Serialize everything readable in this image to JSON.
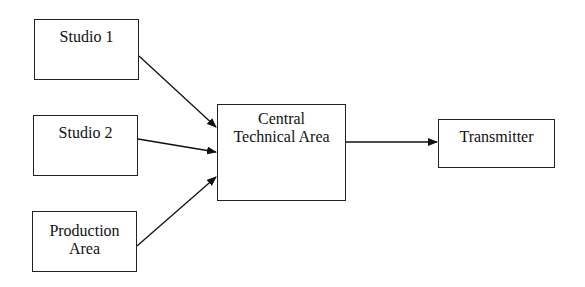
{
  "nodes": [
    {
      "id": "studio1",
      "label": "Studio 1",
      "x": 34,
      "y": 19,
      "w": 105,
      "h": 61,
      "pad": 8
    },
    {
      "id": "studio2",
      "label": "Studio 2",
      "x": 33,
      "y": 115,
      "w": 105,
      "h": 61,
      "pad": 8
    },
    {
      "id": "production",
      "label": "Production Area",
      "line1": "Production",
      "line2": "Area",
      "x": 32,
      "y": 211,
      "w": 105,
      "h": 61,
      "pad": 8
    },
    {
      "id": "central",
      "label": "Central Technical Area",
      "line1": "Central",
      "line2": "Technical Area",
      "x": 217,
      "y": 104,
      "w": 129,
      "h": 97,
      "pad": 5
    },
    {
      "id": "transmitter",
      "label": "Transmitter",
      "x": 438,
      "y": 119,
      "w": 117,
      "h": 49,
      "pad": 8
    }
  ],
  "edges": [
    {
      "from": "studio1",
      "to": "central"
    },
    {
      "from": "studio2",
      "to": "central"
    },
    {
      "from": "production",
      "to": "central"
    },
    {
      "from": "central",
      "to": "transmitter"
    }
  ],
  "labels": {
    "studio1": "Studio 1",
    "studio2": "Studio 2",
    "production_l1": "Production",
    "production_l2": "Area",
    "central_l1": "Central",
    "central_l2": "Technical Area",
    "transmitter": "Transmitter"
  }
}
